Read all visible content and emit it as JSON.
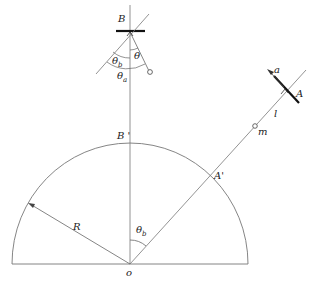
{
  "figure": {
    "type": "physics-diagram",
    "labels": {
      "B": "B",
      "B_prime": "B '",
      "A": "A",
      "A_prime": "A'",
      "a": "a",
      "l": "l",
      "m": "m",
      "R": "R",
      "o": "o",
      "theta": "θ",
      "theta_a": "θ",
      "theta_a_sub": "a",
      "theta_b": "θ",
      "theta_b_sub": "b",
      "theta_b_lower": "θ",
      "theta_b_lower_sub": "b"
    },
    "caption": ""
  }
}
